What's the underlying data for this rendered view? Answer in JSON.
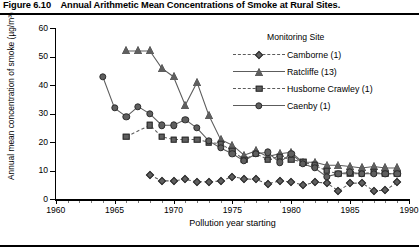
{
  "figure": {
    "number": "Figure 6.10",
    "caption": "Annual Arithmetic Mean Concentrations of Smoke at Rural Sites."
  },
  "legend": {
    "title": "Monitoring Site",
    "entries": [
      {
        "label": "Camborne (1)",
        "marker": "diamond",
        "line": "dashed",
        "color": "#5f5f5f"
      },
      {
        "label": "Ratcliffe (13)",
        "marker": "triangle",
        "line": "solid",
        "color": "#5f5f5f"
      },
      {
        "label": "Husborne Crawley (1)",
        "marker": "square",
        "line": "dashed",
        "color": "#5f5f5f"
      },
      {
        "label": "Caenby (1)",
        "marker": "circle",
        "line": "solid",
        "color": "#5f5f5f"
      }
    ]
  },
  "chart_data": {
    "type": "line",
    "title": "Annual Arithmetic Mean Concentrations of Smoke at Rural Sites.",
    "xlabel": "Pollution year starting",
    "ylabel": "Annual mean concentration of smoke (µg/m³)",
    "xlim": [
      1960,
      1990
    ],
    "ylim": [
      0,
      60
    ],
    "xticks": [
      1960,
      1965,
      1970,
      1975,
      1980,
      1985,
      1990
    ],
    "yticks": [
      0,
      10,
      20,
      30,
      40,
      50,
      60
    ],
    "grid": false,
    "legend_position": "top-right",
    "series": [
      {
        "name": "Camborne (1)",
        "marker": "diamond",
        "line": "dashed",
        "x": [
          1968,
          1969,
          1970,
          1971,
          1972,
          1973,
          1974,
          1975,
          1976,
          1977,
          1978,
          1979,
          1980,
          1981,
          1982,
          1983,
          1984,
          1985,
          1986,
          1987,
          1988,
          1989
        ],
        "y": [
          8.5,
          6.5,
          6.5,
          7.0,
          6.2,
          6.2,
          6.4,
          8.0,
          7.2,
          7.0,
          5.5,
          6.4,
          6.2,
          5.0,
          6.0,
          5.8,
          3.0,
          5.6,
          5.8,
          3.0,
          3.2,
          6.0
        ]
      },
      {
        "name": "Ratcliffe (13)",
        "marker": "triangle",
        "line": "solid",
        "x": [
          1966,
          1967,
          1968,
          1969,
          1970,
          1971,
          1972,
          1973,
          1974,
          1975,
          1976,
          1977,
          1978,
          1979,
          1980,
          1981,
          1982,
          1983,
          1984,
          1985,
          1986,
          1987,
          1988,
          1989
        ],
        "y": [
          52.0,
          52.0,
          52.0,
          46.0,
          43.0,
          33.0,
          41.0,
          29.5,
          21.0,
          19.0,
          15.5,
          17.0,
          15.0,
          16.0,
          16.5,
          13.0,
          13.0,
          12.0,
          12.0,
          11.5,
          11.0,
          11.5,
          11.0,
          11.0
        ]
      },
      {
        "name": "Husborne Crawley (1)",
        "marker": "square",
        "line": "dashed",
        "x": [
          1966,
          1968,
          1969,
          1970,
          1971,
          1972,
          1973,
          1974,
          1975,
          1976,
          1977,
          1978,
          1979,
          1980,
          1981,
          1982,
          1983,
          1984,
          1985,
          1986,
          1987,
          1988,
          1989
        ],
        "y": [
          22.0,
          26.0,
          22.0,
          21.0,
          21.0,
          21.0,
          20.0,
          19.5,
          17.0,
          14.0,
          16.0,
          14.0,
          15.0,
          14.0,
          13.0,
          12.0,
          10.0,
          9.0,
          9.0,
          9.0,
          9.5,
          9.0,
          9.0
        ]
      },
      {
        "name": "Caenby (1)",
        "marker": "circle",
        "line": "solid",
        "x": [
          1964,
          1965,
          1966,
          1967,
          1968,
          1969,
          1970,
          1971,
          1972,
          1973,
          1974,
          1975,
          1976,
          1977,
          1978,
          1979,
          1980,
          1981,
          1982,
          1983,
          1984,
          1985,
          1986,
          1987,
          1988,
          1989
        ],
        "y": [
          43.0,
          32.0,
          29.0,
          32.5,
          30.0,
          26.0,
          26.0,
          28.0,
          25.0,
          20.5,
          18.0,
          16.0,
          13.5,
          16.0,
          16.5,
          13.0,
          16.0,
          12.5,
          11.0,
          8.0,
          9.0,
          9.5,
          9.0,
          9.0,
          9.0,
          9.0
        ]
      }
    ]
  }
}
